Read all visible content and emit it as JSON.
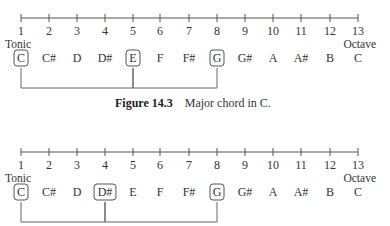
{
  "scale": {
    "numbers": [
      "1",
      "2",
      "3",
      "4",
      "5",
      "6",
      "7",
      "8",
      "9",
      "10",
      "11",
      "12",
      "13"
    ],
    "notes": [
      "C",
      "C#",
      "D",
      "D#",
      "E",
      "F",
      "F#",
      "G",
      "G#",
      "A",
      "A#",
      "B",
      "C"
    ],
    "tonic_label": "Tonic",
    "octave_label": "Octave"
  },
  "figures": [
    {
      "caption_label": "Figure 14.3",
      "caption_text": "Major chord in C.",
      "highlighted": [
        0,
        4,
        7
      ]
    },
    {
      "caption_label": "Figure 14.4",
      "caption_text": "Minor chord in C.",
      "highlighted": [
        0,
        3,
        7
      ]
    }
  ]
}
